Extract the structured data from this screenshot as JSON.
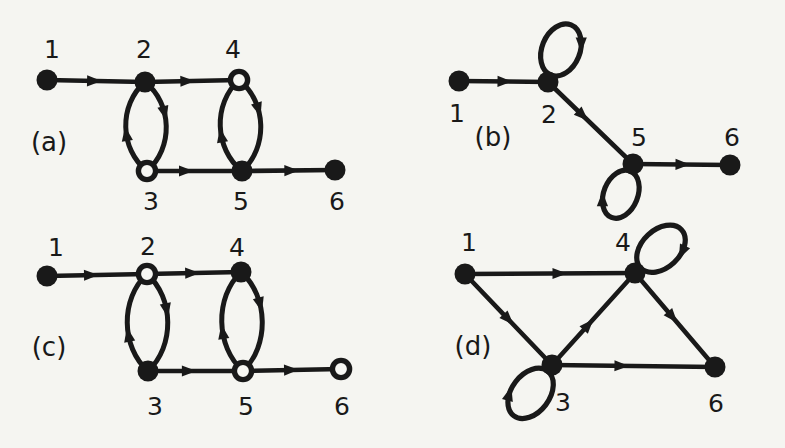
{
  "figure": {
    "width": 785,
    "height": 448,
    "background": "#f5f5f1",
    "ink": "#191919",
    "paper": "#f7f7f3",
    "node_radius": 10.5,
    "panels": [
      {
        "id": "a",
        "label": "(a)",
        "label_x": 49,
        "label_y": 142,
        "nodes": [
          {
            "id": "1",
            "label": "1",
            "x": 47,
            "y": 80,
            "filled": true,
            "lx": 52,
            "ly": 49
          },
          {
            "id": "2",
            "label": "2",
            "x": 145,
            "y": 82,
            "filled": true,
            "lx": 144,
            "ly": 49
          },
          {
            "id": "4",
            "label": "4",
            "x": 239,
            "y": 80,
            "filled": false,
            "lx": 233,
            "ly": 49
          },
          {
            "id": "3",
            "label": "3",
            "x": 147,
            "y": 171,
            "filled": false,
            "lx": 151,
            "ly": 201
          },
          {
            "id": "5",
            "label": "5",
            "x": 242,
            "y": 171,
            "filled": true,
            "lx": 241,
            "ly": 201
          },
          {
            "id": "6",
            "label": "6",
            "x": 335,
            "y": 170,
            "filled": true,
            "lx": 337,
            "ly": 201
          }
        ],
        "edges": [
          {
            "type": "line",
            "from": "1",
            "to": "2",
            "arrows": [
              {
                "t": 0.47
              }
            ]
          },
          {
            "type": "line",
            "from": "2",
            "to": "4",
            "arrows": [
              {
                "t": 0.44
              }
            ]
          },
          {
            "type": "lens",
            "from": "2",
            "to": "3",
            "bulge": 27,
            "arrows": [
              {
                "curve": "L",
                "t": 0.58,
                "rev": true
              },
              {
                "curve": "R",
                "t": 0.36,
                "rev": false
              }
            ]
          },
          {
            "type": "lens",
            "from": "4",
            "to": "5",
            "bulge": 27,
            "arrows": [
              {
                "curve": "L",
                "t": 0.6,
                "rev": true
              },
              {
                "curve": "R",
                "t": 0.34,
                "rev": false
              }
            ]
          },
          {
            "type": "line",
            "from": "3",
            "to": "5",
            "arrows": [
              {
                "t": 0.4
              }
            ]
          },
          {
            "type": "line",
            "from": "5",
            "to": "6",
            "arrows": [
              {
                "t": 0.52
              }
            ]
          }
        ]
      },
      {
        "id": "b",
        "label": "(b)",
        "label_x": 493,
        "label_y": 137,
        "nodes": [
          {
            "id": "1",
            "label": "1",
            "x": 459,
            "y": 81,
            "filled": true,
            "lx": 457,
            "ly": 113
          },
          {
            "id": "2",
            "label": "2",
            "x": 548,
            "y": 82,
            "filled": true,
            "lx": 549,
            "ly": 114
          },
          {
            "id": "5",
            "label": "5",
            "x": 633,
            "y": 164,
            "filled": true,
            "lx": 639,
            "ly": 137
          },
          {
            "id": "6",
            "label": "6",
            "x": 730,
            "y": 165,
            "filled": true,
            "lx": 732,
            "ly": 137
          }
        ],
        "edges": [
          {
            "type": "line",
            "from": "1",
            "to": "2",
            "arrows": [
              {
                "t": 0.5
              }
            ]
          },
          {
            "type": "loop",
            "node": "2",
            "angle": -68,
            "rx": 27,
            "ry": 19,
            "arrow_phi": 60
          },
          {
            "type": "line",
            "from": "2",
            "to": "5",
            "arrows": [
              {
                "t": 0.4
              }
            ]
          },
          {
            "type": "loop",
            "node": "5",
            "angle": 112,
            "rx": 25,
            "ry": 17,
            "arrow_phi": 60
          },
          {
            "type": "line",
            "from": "5",
            "to": "6",
            "arrows": [
              {
                "t": 0.5
              }
            ]
          }
        ]
      },
      {
        "id": "c",
        "label": "(c)",
        "label_x": 49,
        "label_y": 347,
        "nodes": [
          {
            "id": "1",
            "label": "1",
            "x": 47,
            "y": 276,
            "filled": true,
            "lx": 56,
            "ly": 247
          },
          {
            "id": "2",
            "label": "2",
            "x": 147,
            "y": 274,
            "filled": false,
            "lx": 148,
            "ly": 246
          },
          {
            "id": "4",
            "label": "4",
            "x": 241,
            "y": 272,
            "filled": true,
            "lx": 237,
            "ly": 247
          },
          {
            "id": "3",
            "label": "3",
            "x": 148,
            "y": 371,
            "filled": true,
            "lx": 155,
            "ly": 406
          },
          {
            "id": "5",
            "label": "5",
            "x": 243,
            "y": 371,
            "filled": false,
            "lx": 246,
            "ly": 406
          },
          {
            "id": "6",
            "label": "6",
            "x": 341,
            "y": 369,
            "filled": false,
            "lx": 342,
            "ly": 406
          }
        ],
        "edges": [
          {
            "type": "line",
            "from": "1",
            "to": "2",
            "arrows": [
              {
                "t": 0.43
              }
            ]
          },
          {
            "type": "line",
            "from": "2",
            "to": "4",
            "arrows": [
              {
                "t": 0.47
              }
            ]
          },
          {
            "type": "lens",
            "from": "2",
            "to": "3",
            "bulge": 27,
            "arrows": [
              {
                "curve": "L",
                "t": 0.62,
                "rev": true
              },
              {
                "curve": "R",
                "t": 0.38,
                "rev": false
              }
            ]
          },
          {
            "type": "lens",
            "from": "4",
            "to": "5",
            "bulge": 27,
            "arrows": [
              {
                "curve": "L",
                "t": 0.6,
                "rev": true
              },
              {
                "curve": "R",
                "t": 0.34,
                "rev": false
              }
            ]
          },
          {
            "type": "line",
            "from": "3",
            "to": "5",
            "arrows": [
              {
                "t": 0.42
              }
            ]
          },
          {
            "type": "line",
            "from": "5",
            "to": "6",
            "arrows": [
              {
                "t": 0.48
              }
            ]
          }
        ]
      },
      {
        "id": "d",
        "label": "(d)",
        "label_x": 473,
        "label_y": 346,
        "nodes": [
          {
            "id": "1",
            "label": "1",
            "x": 465,
            "y": 274,
            "filled": true,
            "lx": 469,
            "ly": 242
          },
          {
            "id": "4",
            "label": "4",
            "x": 635,
            "y": 273,
            "filled": true,
            "lx": 623,
            "ly": 242
          },
          {
            "id": "3",
            "label": "3",
            "x": 552,
            "y": 365,
            "filled": true,
            "lx": 563,
            "ly": 402
          },
          {
            "id": "6",
            "label": "6",
            "x": 715,
            "y": 367,
            "filled": true,
            "lx": 716,
            "ly": 403
          }
        ],
        "edges": [
          {
            "type": "line",
            "from": "1",
            "to": "4",
            "arrows": [
              {
                "t": 0.55
              }
            ]
          },
          {
            "type": "line",
            "from": "1",
            "to": "3",
            "arrows": [
              {
                "t": 0.49
              }
            ]
          },
          {
            "type": "line",
            "from": "3",
            "to": "4",
            "arrows": [
              {
                "t": 0.43
              }
            ]
          },
          {
            "type": "line",
            "from": "4",
            "to": "6",
            "arrows": [
              {
                "t": 0.46
              }
            ]
          },
          {
            "type": "line",
            "from": "3",
            "to": "6",
            "arrows": [
              {
                "t": 0.42
              }
            ]
          },
          {
            "type": "loop",
            "node": "4",
            "angle": -43,
            "rx": 28,
            "ry": 19,
            "arrow_phi": 60
          },
          {
            "type": "loop",
            "node": "3",
            "angle": 127,
            "rx": 28,
            "ry": 19,
            "arrow_phi": 60
          }
        ]
      }
    ]
  }
}
